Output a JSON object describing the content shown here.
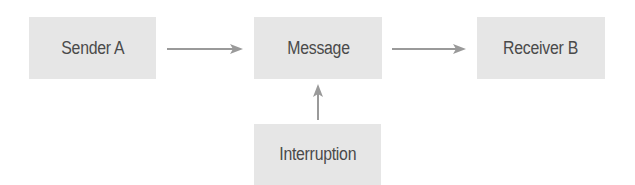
{
  "diagram": {
    "type": "flow",
    "colors": {
      "node_fill": "#e6e6e6",
      "node_text": "#4a4a4a",
      "arrow": "#9a9a9a"
    },
    "nodes": [
      {
        "id": "sender",
        "label": "Sender A"
      },
      {
        "id": "message",
        "label": "Message"
      },
      {
        "id": "receiver",
        "label": "Receiver B"
      },
      {
        "id": "interruption",
        "label": "Interruption"
      }
    ],
    "edges": [
      {
        "from": "Sender A",
        "to": "Message"
      },
      {
        "from": "Message",
        "to": "Receiver B"
      },
      {
        "from": "Interruption",
        "to": "Message"
      }
    ]
  }
}
